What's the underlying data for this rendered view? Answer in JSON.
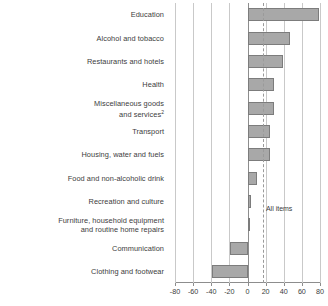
{
  "chart_data": {
    "type": "bar",
    "orientation": "horizontal",
    "title": "",
    "xlabel": "",
    "ylabel": "",
    "xlim": [
      -80,
      80
    ],
    "xticks": [
      -80,
      -60,
      -40,
      -20,
      0,
      20,
      40,
      60,
      80
    ],
    "grid": true,
    "legend": null,
    "categories": [
      "Education",
      "Alcohol and tobacco",
      "Restaurants and hotels",
      "Health",
      "Miscellaneous goods and services",
      "Transport",
      "Housing, water and fuels",
      "Food and non-alcoholic drink",
      "Recreation and culture",
      "Furniture, household equipment and routine home repairs",
      "Communication",
      "Clothing and footwear"
    ],
    "category_lines": [
      [
        "Education"
      ],
      [
        "Alcohol and tobacco"
      ],
      [
        "Restaurants and hotels"
      ],
      [
        "Health"
      ],
      [
        "Miscellaneous goods",
        "and services"
      ],
      [
        "Transport"
      ],
      [
        "Housing, water and fuels"
      ],
      [
        "Food and non-alcoholic drink"
      ],
      [
        "Recreation and culture"
      ],
      [
        "Furniture, household equipment",
        "and routine home repairs"
      ],
      [
        "Communication"
      ],
      [
        "Clothing and footwear"
      ]
    ],
    "footnote_marker_index": 4,
    "footnote_marker": "2",
    "values": [
      79,
      47,
      39,
      29,
      29,
      25,
      25,
      10,
      4,
      1,
      -19,
      -39
    ],
    "bar_color": "#a8a8a8",
    "bar_border_color": "#7c7c7c",
    "reference_line": {
      "label": "All items",
      "value": 17,
      "style": "dashed",
      "color": "#9a9a9a"
    }
  },
  "axis": {
    "tick_labels": [
      "-80",
      "-60",
      "-40",
      "-20",
      "0",
      "20",
      "40",
      "60",
      "80"
    ]
  }
}
